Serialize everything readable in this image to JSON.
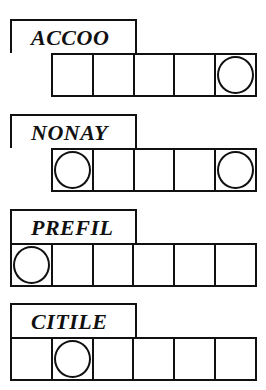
{
  "puzzles": [
    {
      "scrambled": "ACCOO",
      "letters": 5,
      "circled_positions": [
        5
      ]
    },
    {
      "scrambled": "NONAY",
      "letters": 5,
      "circled_positions": [
        1,
        5
      ]
    },
    {
      "scrambled": "PREFIL",
      "letters": 6,
      "circled_positions": [
        1
      ]
    },
    {
      "scrambled": "CITILE",
      "letters": 6,
      "circled_positions": [
        2
      ]
    }
  ]
}
